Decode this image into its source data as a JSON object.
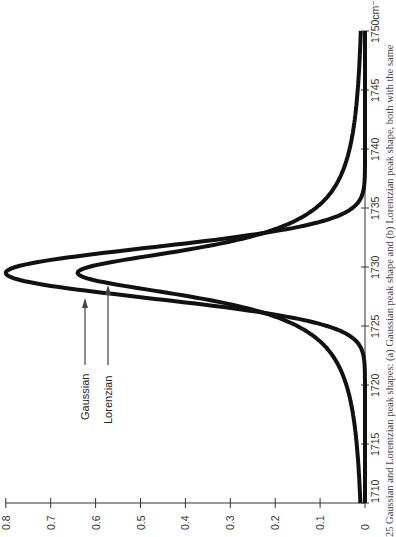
{
  "chart_data": {
    "type": "line",
    "orientation": "rotated-90-ccw",
    "title": "",
    "xlabel": "cm⁻¹",
    "ylabel": "",
    "x_ticks": [
      1710,
      1715,
      1720,
      1725,
      1730,
      1735,
      1740,
      1745,
      1750
    ],
    "x_tick_labels": [
      "1710",
      "1715",
      "1720",
      "1725",
      "1730",
      "1735",
      "1740",
      "1745",
      "1750cm⁻¹"
    ],
    "y_ticks": [
      0,
      0.1,
      0.2,
      0.3,
      0.4,
      0.5,
      0.6,
      0.7,
      0.8
    ],
    "y_tick_labels": [
      "0",
      "0.1",
      "0.2",
      "0.3",
      "0.4",
      "0.5",
      "0.6",
      "0.7",
      "0.8"
    ],
    "xlim": [
      1710,
      1750
    ],
    "ylim": [
      0,
      0.8
    ],
    "grid": false,
    "legend": "none (arrow annotations)",
    "series": [
      {
        "name": "Gaussian",
        "shape": "gaussian",
        "center": 1729.5,
        "peak": 0.8,
        "fwhm": 5.0,
        "x": [
          1710,
          1715,
          1720,
          1722,
          1724,
          1725,
          1726,
          1727,
          1728,
          1729,
          1729.5,
          1730,
          1731,
          1732,
          1733,
          1734,
          1735,
          1737,
          1740,
          1745,
          1750
        ],
        "values": [
          0.0,
          0.0,
          0.0,
          0.01,
          0.05,
          0.1,
          0.21,
          0.37,
          0.56,
          0.75,
          0.8,
          0.75,
          0.56,
          0.37,
          0.21,
          0.1,
          0.05,
          0.005,
          0.0,
          0.0,
          0.0
        ]
      },
      {
        "name": "Lorenzian",
        "shape": "lorentzian",
        "center": 1729.5,
        "peak": 0.64,
        "fwhm": 5.0,
        "x": [
          1710,
          1715,
          1720,
          1722,
          1724,
          1725,
          1726,
          1727,
          1728,
          1729,
          1729.5,
          1730,
          1731,
          1732,
          1733,
          1734,
          1735,
          1737,
          1740,
          1745,
          1750
        ],
        "values": [
          0.01,
          0.02,
          0.04,
          0.06,
          0.11,
          0.15,
          0.22,
          0.32,
          0.47,
          0.6,
          0.64,
          0.6,
          0.47,
          0.32,
          0.22,
          0.15,
          0.11,
          0.06,
          0.03,
          0.015,
          0.01
        ]
      }
    ],
    "annotations": [
      {
        "text": "Gaussian",
        "arrow_to_series": "Gaussian"
      },
      {
        "text": "Lorenzian",
        "arrow_to_series": "Lorenzian"
      }
    ],
    "caption_partial": "Gaussian and Lorentzian peak shapes: (a) Gaussian peak shape and (b) Lorentzian peak shape, both with the same"
  },
  "labels": {
    "gaussian": "Gaussian",
    "lorenzian": "Lorenzian",
    "caption": "25  Gaussian and Lorentzian peak shapes: (a) Gaussian peak shape and (b) Lorentzian peak shape, both with the same"
  },
  "colors": {
    "curve": "#111111",
    "axis": "#333333",
    "arrow": "#444444"
  }
}
